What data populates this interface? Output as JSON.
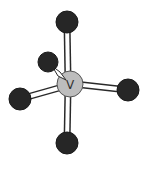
{
  "diagram": {
    "type": "molecular-geometry",
    "central_atom": {
      "label": "V",
      "x": 70,
      "y": 84,
      "r": 13,
      "color": "#bdbdbd"
    },
    "ligands": [
      {
        "name": "top",
        "x": 67,
        "y": 22,
        "r": 11
      },
      {
        "name": "upper-left",
        "x": 48,
        "y": 62,
        "r": 10
      },
      {
        "name": "left",
        "x": 20,
        "y": 99,
        "r": 11
      },
      {
        "name": "right",
        "x": 128,
        "y": 90,
        "r": 11
      },
      {
        "name": "bottom",
        "x": 67,
        "y": 143,
        "r": 11
      }
    ],
    "ligand_color": "#262626",
    "bond_color": "#ffffff",
    "bond_outline_color": "#2a2a2a"
  }
}
